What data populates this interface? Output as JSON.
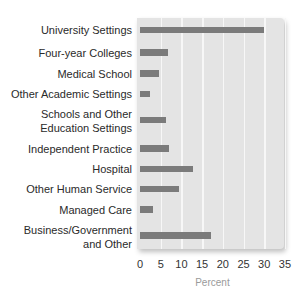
{
  "chart_data": {
    "type": "bar",
    "orientation": "horizontal",
    "title": "",
    "xlabel": "Percent",
    "ylabel": "",
    "xlim": [
      0,
      35
    ],
    "xticks": [
      "0",
      "5",
      "10",
      "15",
      "20",
      "25",
      "30",
      "35"
    ],
    "grid": true,
    "legend": null,
    "categories": [
      "University Settings",
      "Four-year Colleges",
      "Medical School",
      "Other Academic Settings",
      "Schools and Other Education Settings",
      "Independent Practice",
      "Hospital",
      "Other Human Service",
      "Managed Care",
      "Business/Government and Other"
    ],
    "label_lines": [
      [
        "University Settings"
      ],
      [
        "Four-year Colleges"
      ],
      [
        "Medical School"
      ],
      [
        "Other Academic Settings"
      ],
      [
        "Schools and Other",
        "Education Settings"
      ],
      [
        "Independent Practice"
      ],
      [
        "Hospital"
      ],
      [
        "Other Human Service"
      ],
      [
        "Managed Care"
      ],
      [
        "Business/Government",
        "and Other"
      ]
    ],
    "values": [
      30.0,
      6.7,
      4.7,
      2.4,
      6.4,
      7.1,
      12.7,
      9.3,
      3.1,
      17.2
    ],
    "row_centers_px": [
      30,
      52.5,
      73.5,
      94,
      120,
      148.5,
      169,
      189,
      209.5,
      235.5
    ],
    "colors": {
      "bar": "#7b7b7b",
      "plot_bg": "#e4e4e4",
      "grid": "#f7f7f7",
      "axis_label": "#9a9a9a"
    }
  }
}
